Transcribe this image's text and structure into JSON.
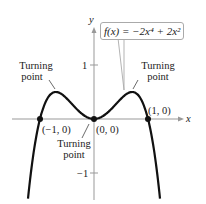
{
  "chart_data": {
    "type": "line",
    "title": "",
    "function_label": "f(x) = −2x⁴ + 2x²",
    "xlabel": "x",
    "ylabel": "y",
    "xlim": [
      -1.5,
      1.5
    ],
    "ylim": [
      -1.5,
      1.5
    ],
    "y_ticks": [
      {
        "value": 1,
        "label": "1"
      },
      {
        "value": -1,
        "label": "−1"
      }
    ],
    "grid": false,
    "series": [
      {
        "name": "f(x) = -2x^4 + 2x^2",
        "x": [
          -1.3,
          -1.2,
          -1.1,
          -1.0,
          -0.9,
          -0.8,
          -0.707,
          -0.6,
          -0.5,
          -0.4,
          -0.3,
          -0.2,
          -0.1,
          0.0,
          0.1,
          0.2,
          0.3,
          0.4,
          0.5,
          0.6,
          0.707,
          0.8,
          0.9,
          1.0,
          1.1,
          1.2,
          1.3
        ],
        "y": [
          -2.33,
          -1.27,
          -0.51,
          0.0,
          0.31,
          0.46,
          0.5,
          0.46,
          0.375,
          0.27,
          0.16,
          0.08,
          0.02,
          0.0,
          0.02,
          0.08,
          0.16,
          0.27,
          0.375,
          0.46,
          0.5,
          0.46,
          0.31,
          0.0,
          -0.51,
          -1.27,
          -2.33
        ]
      }
    ],
    "points": [
      {
        "x": -1,
        "y": 0,
        "label": "(−1, 0)"
      },
      {
        "x": 0,
        "y": 0,
        "label": "(0, 0)"
      },
      {
        "x": 1,
        "y": 0,
        "label": "(1, 0)"
      }
    ],
    "annotations": [
      {
        "text": "Turning point",
        "x": -0.707,
        "y": 0.5
      },
      {
        "text": "Turning point",
        "x": 0,
        "y": 0
      },
      {
        "text": "Turning point",
        "x": 0.707,
        "y": 0.5
      }
    ]
  },
  "labels": {
    "equation": "f(x) = −2x⁴ + 2x²",
    "x_axis": "x",
    "y_axis": "y",
    "tick_pos1": "1",
    "tick_neg1": "−1",
    "pt_neg1": "(−1, 0)",
    "pt_origin": "(0, 0)",
    "pt_pos1": "(1, 0)",
    "turning_left_1": "Turning",
    "turning_left_2": "point",
    "turning_right_1": "Turning",
    "turning_right_2": "point",
    "turning_mid_1": "Turning",
    "turning_mid_2": "point"
  }
}
